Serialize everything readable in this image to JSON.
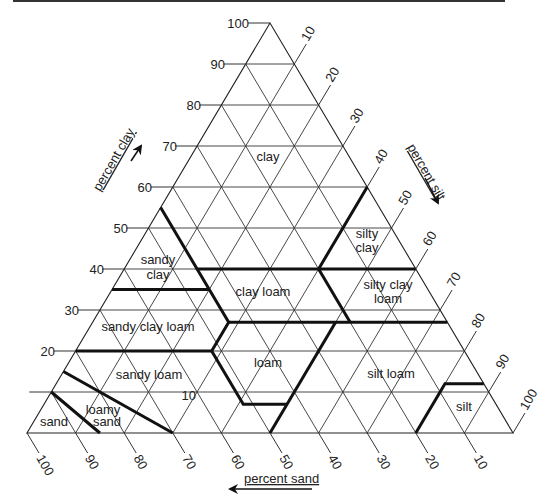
{
  "diagram": {
    "axes": {
      "clay": {
        "title": "percent clay",
        "ticks": [
          "10",
          "20",
          "30",
          "40",
          "50",
          "60",
          "70",
          "80",
          "90",
          "100"
        ]
      },
      "silt": {
        "title": "percent silt",
        "ticks": [
          "10",
          "20",
          "30",
          "40",
          "50",
          "60",
          "70",
          "80",
          "90",
          "100"
        ]
      },
      "sand": {
        "title": "percent sand",
        "ticks": [
          "100",
          "90",
          "80",
          "70",
          "60",
          "50",
          "40",
          "30",
          "20",
          "10"
        ]
      }
    },
    "regions": [
      {
        "id": "clay",
        "lines": [
          "clay"
        ]
      },
      {
        "id": "silty-clay",
        "lines": [
          "silty",
          "clay"
        ]
      },
      {
        "id": "sandy-clay",
        "lines": [
          "sandy",
          "clay"
        ]
      },
      {
        "id": "clay-loam",
        "lines": [
          "clay loam"
        ]
      },
      {
        "id": "silty-clay-loam",
        "lines": [
          "silty clay",
          "loam"
        ]
      },
      {
        "id": "sandy-clay-loam",
        "lines": [
          "sandy clay loam"
        ]
      },
      {
        "id": "loam",
        "lines": [
          "loam"
        ]
      },
      {
        "id": "sandy-loam",
        "lines": [
          "sandy loam"
        ]
      },
      {
        "id": "silt-loam",
        "lines": [
          "silt loam"
        ]
      },
      {
        "id": "silt",
        "lines": [
          "silt"
        ]
      },
      {
        "id": "loamy-sand",
        "lines": [
          "loamy",
          "sand"
        ]
      },
      {
        "id": "sand",
        "lines": [
          "sand"
        ]
      }
    ]
  },
  "labels": {
    "clay_title": "percent clay",
    "silt_title": "percent silt",
    "sand_title": "percent sand",
    "clay_ticks": [
      "10",
      "20",
      "30",
      "40",
      "50",
      "60",
      "70",
      "80",
      "90",
      "100"
    ],
    "silt_ticks": [
      "10",
      "20",
      "30",
      "40",
      "50",
      "60",
      "70",
      "80",
      "90",
      "100"
    ],
    "sand_ticks": [
      "10",
      "20",
      "30",
      "40",
      "50",
      "60",
      "70",
      "80",
      "90",
      "100"
    ],
    "region_clay": "clay",
    "region_silty_clay_1": "silty",
    "region_silty_clay_2": "clay",
    "region_sandy_clay_1": "sandy",
    "region_sandy_clay_2": "clay",
    "region_clay_loam": "clay loam",
    "region_silty_clay_loam_1": "silty clay",
    "region_silty_clay_loam_2": "loam",
    "region_sandy_clay_loam": "sandy clay loam",
    "region_loam": "loam",
    "region_sandy_loam": "sandy loam",
    "region_silt_loam": "silt loam",
    "region_silt": "silt",
    "region_loamy_sand_1": "loamy",
    "region_loamy_sand_2": "sand",
    "region_sand": "sand"
  }
}
